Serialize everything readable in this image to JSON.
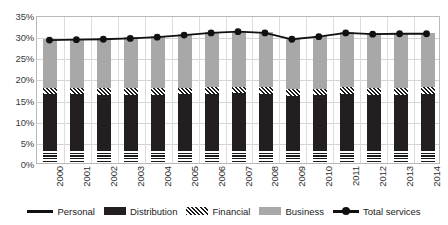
{
  "chart_data": {
    "type": "bar",
    "subtype": "stacked-bar-with-line",
    "title": "",
    "subtitle": "",
    "xlabel": "",
    "ylabel": "",
    "ylim": [
      0,
      35
    ],
    "ytick_step": 5,
    "ytick_labels": [
      "0%",
      "5%",
      "10%",
      "15%",
      "20%",
      "25%",
      "30%",
      "35%"
    ],
    "ytick_values": [
      0,
      5,
      10,
      15,
      20,
      25,
      30,
      35
    ],
    "grid": true,
    "legend_position": "bottom",
    "categories": [
      "2000",
      "2001",
      "2002",
      "2003",
      "2004",
      "2005",
      "2006",
      "2007",
      "2008",
      "2009",
      "2010",
      "2011",
      "2012",
      "2013",
      "2014"
    ],
    "series": [
      {
        "name": "Personal",
        "type": "bar-segment",
        "pattern": "horizontal-stripes",
        "color": "#1a1a1a",
        "values": [
          3.0,
          3.0,
          3.0,
          3.0,
          3.0,
          3.0,
          3.0,
          3.0,
          3.0,
          3.0,
          3.0,
          3.0,
          3.0,
          3.0,
          3.0
        ]
      },
      {
        "name": "Distribution",
        "type": "bar-segment",
        "pattern": "solid",
        "color": "#231f20",
        "values": [
          13.3,
          13.3,
          13.2,
          13.2,
          13.2,
          13.3,
          13.4,
          13.5,
          13.3,
          12.8,
          13.0,
          13.3,
          13.2,
          13.2,
          13.3
        ]
      },
      {
        "name": "Financial",
        "type": "bar-segment",
        "pattern": "diagonal-hatch",
        "color": "#1a1a1a",
        "values": [
          1.5,
          1.5,
          1.5,
          1.5,
          1.5,
          1.5,
          1.5,
          1.5,
          1.6,
          1.6,
          1.6,
          1.6,
          1.6,
          1.6,
          1.6
        ]
      },
      {
        "name": "Business",
        "type": "bar-segment",
        "pattern": "solid",
        "color": "#a8a8a8",
        "values": [
          11.5,
          11.6,
          11.8,
          12.0,
          12.3,
          12.7,
          13.1,
          13.3,
          13.1,
          12.1,
          12.5,
          13.1,
          12.9,
          13.0,
          12.9
        ]
      },
      {
        "name": "Total services",
        "type": "line",
        "marker": "circle",
        "color": "#111111",
        "values": [
          29.3,
          29.4,
          29.5,
          29.7,
          30.0,
          30.5,
          31.0,
          31.3,
          31.0,
          29.5,
          30.1,
          31.0,
          30.7,
          30.8,
          30.8
        ]
      }
    ]
  },
  "legend": {
    "items": [
      {
        "label": "Personal",
        "swatch": "line-plain"
      },
      {
        "label": "Distribution",
        "swatch": "solid-dark"
      },
      {
        "label": "Financial",
        "swatch": "diagonal-hatch"
      },
      {
        "label": "Business",
        "swatch": "solid-gray"
      },
      {
        "label": "Total services",
        "swatch": "line-with-marker"
      }
    ]
  }
}
